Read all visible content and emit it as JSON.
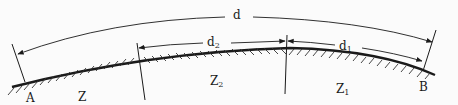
{
  "diagram": {
    "type": "geodesic-path-profile",
    "colors": {
      "ink": "#1a1a1a",
      "background": "#fbfbfb"
    },
    "points": [
      {
        "id": "A",
        "label": "A"
      },
      {
        "id": "B",
        "label": "B"
      }
    ],
    "zones": [
      {
        "id": "Z",
        "label": "Z",
        "sub": ""
      },
      {
        "id": "Z2",
        "label": "Z",
        "sub": "2"
      },
      {
        "id": "Z1",
        "label": "Z",
        "sub": "1"
      }
    ],
    "distances": [
      {
        "id": "d",
        "label": "d",
        "sub": "",
        "from": "A",
        "to": "B"
      },
      {
        "id": "d2",
        "label": "d",
        "sub": "2",
        "from": "Z2-left-boundary",
        "to": "Z2-right-boundary"
      },
      {
        "id": "d1",
        "label": "d",
        "sub": "1",
        "from": "Z1-left-boundary",
        "to": "B"
      }
    ]
  }
}
